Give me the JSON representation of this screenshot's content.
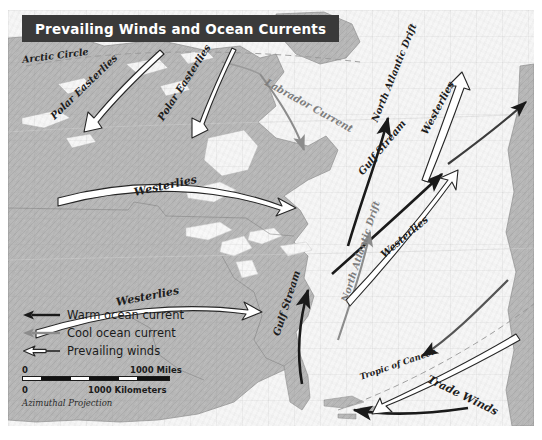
{
  "figure": {
    "title": "Prevailing Winds and Ocean Currents",
    "projection_note": "Azimuthal Projection"
  },
  "colors": {
    "title_bar": "#3a3a3a",
    "title_text": "#ffffff",
    "land": "#b9b9b9",
    "ocean": "#f6f6f6",
    "warm_current": "#1a1a1a",
    "cool_current": "#8c8c8c",
    "wind_arrow_outline": "#262626",
    "wind_arrow_fill": "#ffffff",
    "latitude_line": "#9a9a9a"
  },
  "legend": {
    "items": [
      {
        "label": "Warm ocean current",
        "symbol": "solid-dark-arrow-icon",
        "color": "#1a1a1a"
      },
      {
        "label": "Cool ocean current",
        "symbol": "solid-gray-arrow-icon",
        "color": "#8c8c8c"
      },
      {
        "label": "Prevailing winds",
        "symbol": "hollow-outline-arrow-icon",
        "color": "#262626"
      }
    ]
  },
  "scale": {
    "miles": {
      "start": "0",
      "end": "1000 Miles"
    },
    "kilometers": {
      "start": "0",
      "end": "1000 Kilometers"
    }
  },
  "map_labels": [
    {
      "id": "arctic-circle",
      "text": "Arctic Circle",
      "kind": "latitude",
      "x": 22,
      "y": 50,
      "rot": -7
    },
    {
      "id": "tropic-of-cancer",
      "text": "Tropic of Cancer",
      "kind": "latitude",
      "x": 352,
      "y": 370,
      "rot": -17
    },
    {
      "id": "polar-easterlies-1",
      "text": "Polar Easterlies",
      "kind": "wind",
      "x": 44,
      "y": 110,
      "rot": -44
    },
    {
      "id": "polar-easterlies-2",
      "text": "Polar Easterlies",
      "kind": "wind",
      "x": 152,
      "y": 110,
      "rot": -56
    },
    {
      "id": "westerlies-1",
      "text": "Westerlies",
      "kind": "wind",
      "x": 126,
      "y": 190,
      "rot": -12
    },
    {
      "id": "westerlies-2",
      "text": "Westerlies",
      "kind": "wind",
      "x": 110,
      "y": 298,
      "rot": -11
    },
    {
      "id": "westerlies-3",
      "text": "Westerlies",
      "kind": "wind",
      "x": 374,
      "y": 248,
      "rot": -38
    },
    {
      "id": "westerlies-4",
      "text": "Westerlies",
      "kind": "wind",
      "x": 415,
      "y": 136,
      "rot": -62
    },
    {
      "id": "trade-winds",
      "text": "Trade Winds",
      "kind": "wind",
      "x": 425,
      "y": 372,
      "rot": 26
    },
    {
      "id": "labrador-current",
      "text": "Labrador Current",
      "kind": "cool-current",
      "x": 266,
      "y": 78,
      "rot": 29
    },
    {
      "id": "north-atlantic-drift-1",
      "text": "North Atlantic Drift",
      "kind": "warm-current",
      "x": 372,
      "y": 140,
      "rot": -67
    },
    {
      "id": "north-atlantic-drift-2",
      "text": "North Atlantic Drift",
      "kind": "cool-current",
      "x": 340,
      "y": 318,
      "rot": -72
    },
    {
      "id": "gulf-stream-1",
      "text": "Gulf Stream",
      "kind": "warm-current",
      "x": 356,
      "y": 182,
      "rot": -50
    },
    {
      "id": "gulf-stream-2",
      "text": "Gulf Stream",
      "kind": "warm-current",
      "x": 272,
      "y": 348,
      "rot": -72
    }
  ]
}
